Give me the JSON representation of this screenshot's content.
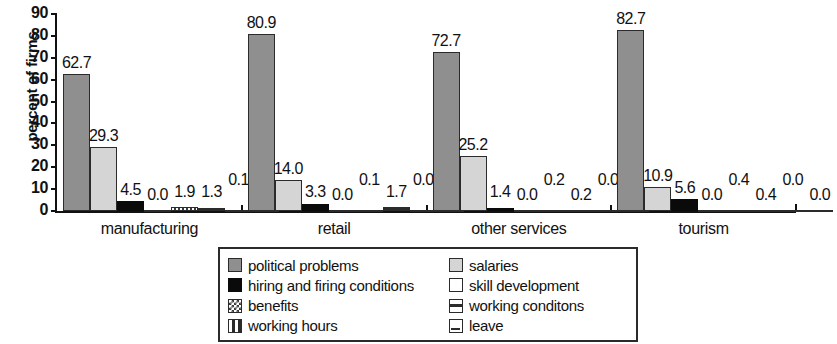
{
  "chart_data": {
    "type": "bar",
    "title": "",
    "xlabel": "",
    "ylabel": "percent of firms",
    "ylim": [
      0,
      90
    ],
    "ytick_labels": [
      "90",
      "80",
      "70",
      "60",
      "50",
      "40",
      "30",
      "20",
      "10",
      "0"
    ],
    "ytick_values": [
      90,
      80,
      70,
      60,
      50,
      40,
      30,
      20,
      10,
      0
    ],
    "grid": false,
    "legend_position": "bottom-center",
    "categories": [
      "manufacturing",
      "retail",
      "other services",
      "tourism"
    ],
    "series": [
      {
        "name": "political problems",
        "pattern": "solid-gray",
        "color": "#8f8f8f",
        "values": [
          62.7,
          80.9,
          72.7,
          82.7
        ]
      },
      {
        "name": "salaries",
        "pattern": "light-gray",
        "color": "#d5d5d5",
        "values": [
          29.3,
          14.0,
          25.2,
          10.9
        ]
      },
      {
        "name": "hiring and firing conditions",
        "pattern": "black",
        "color": "#0a0a0a",
        "values": [
          4.5,
          3.3,
          1.4,
          5.6
        ]
      },
      {
        "name": "skill development",
        "pattern": "white",
        "color": "#ffffff",
        "values": [
          0.0,
          0.0,
          0.0,
          0.0
        ]
      },
      {
        "name": "benefits",
        "pattern": "checker",
        "color": "#3a3a3a",
        "values": [
          1.9,
          0.1,
          0.2,
          0.4
        ]
      },
      {
        "name": "working conditons",
        "pattern": "h-stripe",
        "color": "#2b2b2b",
        "values": [
          1.3,
          1.7,
          0.2,
          0.4
        ]
      },
      {
        "name": "working hours",
        "pattern": "v-stripe",
        "color": "#2b2b2b",
        "values": [
          0.1,
          0.0,
          0.0,
          0.0
        ]
      },
      {
        "name": "leave",
        "pattern": "leave-box",
        "color": "#2b2b2b",
        "values": [
          0.1,
          0.0,
          0.2,
          0.0
        ]
      }
    ],
    "bar_labels": {
      "manufacturing": [
        "62.7",
        "29.3",
        "4.5",
        "0.0",
        "1.9",
        "1.3",
        "0.1",
        "0.1"
      ],
      "retail": [
        "80.9",
        "14.0",
        "3.3",
        "0.0",
        "0.1",
        "1.7",
        "0.0",
        "0.0"
      ],
      "other services": [
        "72.7",
        "25.2",
        "1.4",
        "0.0",
        "0.2",
        "0.2",
        "0.0",
        "0.2"
      ],
      "tourism": [
        "82.7",
        "10.9",
        "5.6",
        "0.0",
        "0.4",
        "0.4",
        "0.0",
        "0.0"
      ]
    }
  },
  "axis": {
    "y_title": "percent of firms",
    "y_ticks": [
      "90",
      "80",
      "70",
      "60",
      "50",
      "40",
      "30",
      "20",
      "10",
      "0"
    ]
  },
  "groups": [
    {
      "label": "manufacturing",
      "labels": [
        "62.7",
        "29.3",
        "4.5",
        "0.0",
        "1.9",
        "1.3",
        "0.1",
        "0.1"
      ]
    },
    {
      "label": "retail",
      "labels": [
        "80.9",
        "14.0",
        "3.3",
        "0.0",
        "0.1",
        "1.7",
        "0.0",
        "0.0"
      ]
    },
    {
      "label": "other services",
      "labels": [
        "72.7",
        "25.2",
        "1.4",
        "0.0",
        "0.2",
        "0.2",
        "0.0",
        "0.2"
      ]
    },
    {
      "label": "tourism",
      "labels": [
        "82.7",
        "10.9",
        "5.6",
        "0.0",
        "0.4",
        "0.4",
        "0.0",
        "0.0"
      ]
    }
  ],
  "legend": {
    "left_column": [
      {
        "label": "political problems",
        "swatch": "solid-gray-swatch"
      },
      {
        "label": "hiring and firing conditions",
        "swatch": "black-swatch"
      },
      {
        "label": "benefits",
        "swatch": "checker-swatch"
      },
      {
        "label": "working hours",
        "swatch": "vertical-stripe-swatch"
      }
    ],
    "right_column": [
      {
        "label": "salaries",
        "swatch": "light-gray-swatch"
      },
      {
        "label": "skill development",
        "swatch": "white-swatch"
      },
      {
        "label": "working conditons",
        "swatch": "horizontal-stripe-swatch"
      },
      {
        "label": "leave",
        "swatch": "leave-box-swatch"
      }
    ]
  }
}
